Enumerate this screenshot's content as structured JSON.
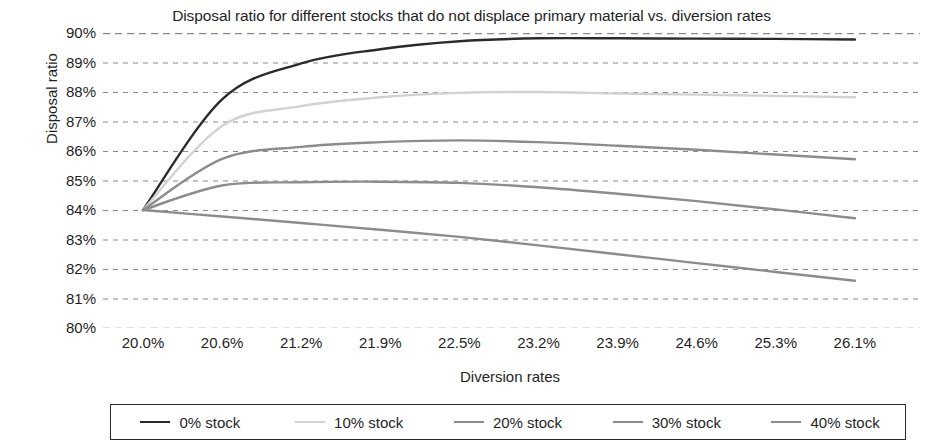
{
  "chart_data": {
    "type": "line",
    "title": "Disposal ratio for different stocks that do not displace primary material vs. diversion rates",
    "xlabel": "Diversion rates",
    "ylabel": "Disposal ratio",
    "grid": true,
    "grid_style": "dashed-horizontal",
    "legend_position": "bottom",
    "categories": [
      "20.0%",
      "20.6%",
      "21.2%",
      "21.9%",
      "22.5%",
      "23.2%",
      "23.9%",
      "24.6%",
      "25.3%",
      "26.1%"
    ],
    "x": [
      20.0,
      20.6,
      21.2,
      21.9,
      22.5,
      23.2,
      23.9,
      24.6,
      25.3,
      26.1
    ],
    "ylim": [
      80,
      90
    ],
    "ytick_labels": [
      "90%",
      "89%",
      "88%",
      "87%",
      "86%",
      "85%",
      "84%",
      "83%",
      "82%",
      "81%",
      "80%"
    ],
    "yticks": [
      90,
      89,
      88,
      87,
      86,
      85,
      84,
      83,
      82,
      81,
      80
    ],
    "series": [
      {
        "name": "0% stock",
        "color": "#2b2b2b",
        "values": [
          84.0,
          87.75,
          88.97,
          89.45,
          89.72,
          89.82,
          89.82,
          89.81,
          89.8,
          89.78
        ]
      },
      {
        "name": "10% stock",
        "color": "#d2d2d2",
        "values": [
          84.0,
          86.85,
          87.52,
          87.82,
          87.97,
          88.0,
          87.95,
          87.91,
          87.87,
          87.82
        ]
      },
      {
        "name": "20% stock",
        "color": "#8c8c8c",
        "values": [
          84.0,
          85.73,
          86.14,
          86.3,
          86.36,
          86.3,
          86.18,
          86.04,
          85.88,
          85.72
        ]
      },
      {
        "name": "30% stock",
        "color": "#8c8c8c",
        "values": [
          84.0,
          84.83,
          84.94,
          84.96,
          84.92,
          84.77,
          84.55,
          84.3,
          84.02,
          83.72
        ]
      },
      {
        "name": "40% stock",
        "color": "#8c8c8c",
        "values": [
          84.0,
          83.78,
          83.56,
          83.33,
          83.09,
          82.8,
          82.5,
          82.2,
          81.9,
          81.6
        ]
      }
    ]
  },
  "legend": {
    "items": [
      {
        "label": "0% stock"
      },
      {
        "label": "10% stock"
      },
      {
        "label": "20% stock"
      },
      {
        "label": "30% stock"
      },
      {
        "label": "40% stock"
      }
    ]
  },
  "colors": {
    "gridline": "#8a8a8a",
    "text": "#1f1f1f",
    "background": "#ffffff",
    "legend_border": "#2a2a2a"
  }
}
